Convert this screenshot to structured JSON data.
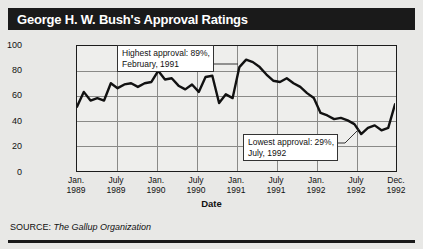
{
  "chart_title": "George H. W. Bush's Approval Ratings",
  "source": {
    "prefix": "SOURCE:",
    "organization": "The Gallup Organization"
  },
  "annotations": {
    "high": {
      "line1": "Highest approval: 89%,",
      "line2": "February, 1991"
    },
    "low": {
      "line1": "Lowest approval: 29%,",
      "line2": "July, 1992"
    }
  },
  "colors": {
    "band": "#1a1a1a",
    "line": "#111111",
    "plot_bg": "#eeeeec",
    "grid": "#8a8a88"
  },
  "chart_data": {
    "type": "line",
    "title": "George H. W. Bush's Approval Ratings",
    "xlabel": "Date",
    "ylabel": "Percent approval rating",
    "ylim": [
      0,
      100
    ],
    "yticks": [
      100,
      80,
      60,
      40,
      20,
      0
    ],
    "xticks": [
      "Jan.\n1989",
      "July\n1989",
      "Jan.\n1990",
      "July\n1990",
      "Jan.\n1991",
      "July\n1991",
      "Jan.\n1992",
      "July\n1992",
      "Dec.\n1992"
    ],
    "xtick_labels": [
      {
        "month": "Jan.",
        "year": "1989"
      },
      {
        "month": "July",
        "year": "1989"
      },
      {
        "month": "Jan.",
        "year": "1990"
      },
      {
        "month": "July",
        "year": "1990"
      },
      {
        "month": "Jan.",
        "year": "1991"
      },
      {
        "month": "July",
        "year": "1991"
      },
      {
        "month": "Jan.",
        "year": "1992"
      },
      {
        "month": "July",
        "year": "1992"
      },
      {
        "month": "Dec.",
        "year": "1992"
      }
    ],
    "grid": true,
    "legend": "none",
    "units": "percent",
    "x": [
      "1989-01",
      "1989-02",
      "1989-03",
      "1989-04",
      "1989-05",
      "1989-06",
      "1989-07",
      "1989-08",
      "1989-09",
      "1989-10",
      "1989-11",
      "1989-12",
      "1990-01",
      "1990-02",
      "1990-03",
      "1990-04",
      "1990-05",
      "1990-06",
      "1990-07",
      "1990-08",
      "1990-09",
      "1990-10",
      "1990-11",
      "1990-12",
      "1991-01",
      "1991-02",
      "1991-03",
      "1991-04",
      "1991-05",
      "1991-06",
      "1991-07",
      "1991-08",
      "1991-09",
      "1991-10",
      "1991-11",
      "1991-12",
      "1992-01",
      "1992-02",
      "1992-03",
      "1992-04",
      "1992-05",
      "1992-06",
      "1992-07",
      "1992-08",
      "1992-09",
      "1992-10",
      "1992-11",
      "1992-12"
    ],
    "values": [
      51,
      63,
      56,
      58,
      56,
      70,
      66,
      69,
      70,
      67,
      70,
      71,
      80,
      73,
      74,
      68,
      65,
      69,
      63,
      75,
      76,
      54,
      61,
      58,
      83,
      89,
      87,
      83,
      77,
      72,
      71,
      74,
      70,
      67,
      62,
      58,
      46,
      44,
      41,
      42,
      40,
      37,
      29,
      34,
      36,
      32,
      34,
      53
    ],
    "series": [
      {
        "name": "Percent approval rating",
        "values": [
          51,
          63,
          56,
          58,
          56,
          70,
          66,
          69,
          70,
          67,
          70,
          71,
          80,
          73,
          74,
          68,
          65,
          69,
          63,
          75,
          76,
          54,
          61,
          58,
          83,
          89,
          87,
          83,
          77,
          72,
          71,
          74,
          70,
          67,
          62,
          58,
          46,
          44,
          41,
          42,
          40,
          37,
          29,
          34,
          36,
          32,
          34,
          53
        ]
      }
    ],
    "annotations": [
      {
        "text": "Highest approval: 89%, February, 1991",
        "x": "1991-02",
        "y": 89
      },
      {
        "text": "Lowest approval: 29%, July, 1992",
        "x": "1992-07",
        "y": 29
      }
    ]
  }
}
